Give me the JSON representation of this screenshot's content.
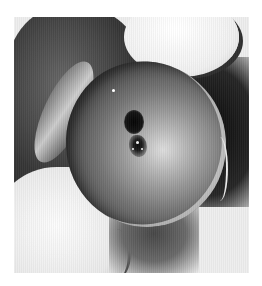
{
  "image": {
    "alt": "Black-and-white clinical photograph of a small ulcerated lesion on a rounded anatomical structure held between fingers",
    "palette": {
      "background": "#ffffff",
      "dark_tone": "#1a1a1a",
      "mid_tone": "#7a7a7a",
      "light_tone": "#e8e8e8"
    }
  }
}
